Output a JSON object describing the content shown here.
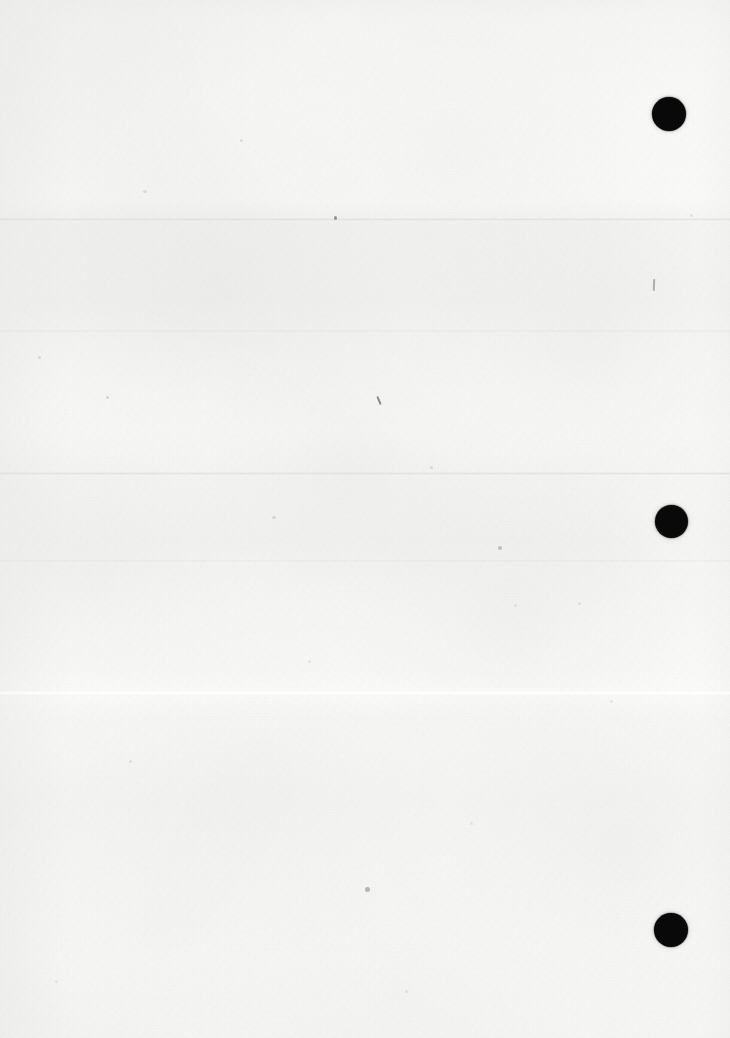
{
  "document": {
    "title": "Blank scanned paper sheet",
    "kind": "scanned-page",
    "orientation": "portrait",
    "width_px": 730,
    "height_px": 1038,
    "visible_text": "",
    "has_text_content": false,
    "description": "A blank, slightly off-white scanned sheet of paper with faint horizontal fold bands, paper grain, scattered ink specks, and three round punch holes along the right edge."
  },
  "colors": {
    "paper_light": "#fafaf9",
    "paper_mid": "#f5f5f4",
    "paper_shadow": "#f1f1f0",
    "punch_hole": "#090909",
    "speck": "#6e6e6c",
    "fold_highlight": "#ffffff",
    "fold_shadow": "#d4d4d2",
    "canvas_background": "#ffffff"
  },
  "punch_holes": [
    {
      "label": "punch-hole-top",
      "x": 652,
      "y": 97,
      "size": 34,
      "shape": "circle"
    },
    {
      "label": "punch-hole-middle",
      "x": 655,
      "y": 505,
      "size": 33,
      "shape": "circle"
    },
    {
      "label": "punch-hole-bottom",
      "x": 654,
      "y": 913,
      "size": 34,
      "shape": "circle"
    }
  ],
  "fold_lines": [
    {
      "label": "fold-upper",
      "y": 218,
      "style": "shadow"
    },
    {
      "label": "band-upper",
      "y": 330,
      "style": "band"
    },
    {
      "label": "fold-middle",
      "y": 472,
      "style": "shadow"
    },
    {
      "label": "band-middle",
      "y": 560,
      "style": "band"
    },
    {
      "label": "fold-lower",
      "y": 693,
      "style": "highlight"
    }
  ],
  "specks": [
    {
      "label": "speck-a",
      "x": 334,
      "y": 216,
      "w": 3,
      "h": 4,
      "opacity": 0.72
    },
    {
      "label": "speck-b",
      "x": 378,
      "y": 396,
      "w": 2,
      "h": 9,
      "opacity": 0.68,
      "rotate": -22,
      "type": "slash"
    },
    {
      "label": "speck-c",
      "x": 653,
      "y": 279,
      "w": 2,
      "h": 12,
      "opacity": 0.55,
      "rotate": 2,
      "type": "slash"
    },
    {
      "label": "speck-d",
      "x": 498,
      "y": 546,
      "w": 4,
      "h": 4,
      "opacity": 0.45
    },
    {
      "label": "speck-e",
      "x": 365,
      "y": 887,
      "w": 5,
      "h": 5,
      "opacity": 0.5
    },
    {
      "label": "speck-f",
      "x": 106,
      "y": 396,
      "w": 3,
      "h": 3,
      "opacity": 0.32
    },
    {
      "label": "speck-g",
      "x": 143,
      "y": 190,
      "w": 4,
      "h": 3,
      "opacity": 0.26
    },
    {
      "label": "speck-h",
      "x": 240,
      "y": 139,
      "w": 3,
      "h": 3,
      "opacity": 0.24
    },
    {
      "label": "speck-i",
      "x": 38,
      "y": 356,
      "w": 3,
      "h": 3,
      "opacity": 0.28
    },
    {
      "label": "speck-j",
      "x": 272,
      "y": 516,
      "w": 4,
      "h": 3,
      "opacity": 0.3
    },
    {
      "label": "speck-k",
      "x": 430,
      "y": 466,
      "w": 3,
      "h": 3,
      "opacity": 0.26
    },
    {
      "label": "speck-l",
      "x": 578,
      "y": 602,
      "w": 3,
      "h": 3,
      "opacity": 0.22
    },
    {
      "label": "speck-m",
      "x": 129,
      "y": 760,
      "w": 3,
      "h": 3,
      "opacity": 0.22
    },
    {
      "label": "speck-n",
      "x": 514,
      "y": 604,
      "w": 3,
      "h": 3,
      "opacity": 0.2
    },
    {
      "label": "speck-o",
      "x": 610,
      "y": 700,
      "w": 3,
      "h": 3,
      "opacity": 0.2
    },
    {
      "label": "speck-p",
      "x": 55,
      "y": 980,
      "w": 3,
      "h": 3,
      "opacity": 0.2
    },
    {
      "label": "speck-q",
      "x": 405,
      "y": 990,
      "w": 3,
      "h": 3,
      "opacity": 0.22
    },
    {
      "label": "speck-r",
      "x": 308,
      "y": 660,
      "w": 3,
      "h": 3,
      "opacity": 0.2
    },
    {
      "label": "speck-s",
      "x": 690,
      "y": 214,
      "w": 3,
      "h": 3,
      "opacity": 0.22
    },
    {
      "label": "speck-t",
      "x": 470,
      "y": 822,
      "w": 3,
      "h": 3,
      "opacity": 0.18
    }
  ]
}
